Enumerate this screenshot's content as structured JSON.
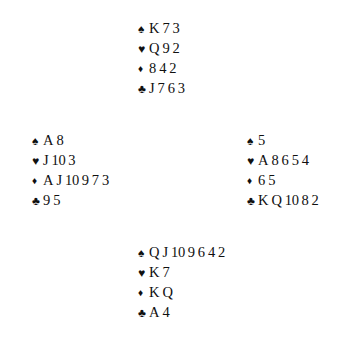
{
  "diagram": {
    "type": "bridge-deal",
    "background_color": "#ffffff",
    "ink_color": "#101010",
    "suit_symbols": {
      "spade": "♠",
      "heart": "♥",
      "diamond": "♦",
      "club": "♣"
    },
    "suit_order": [
      "spade",
      "heart",
      "diamond",
      "club"
    ]
  },
  "hands": {
    "north": {
      "position_label": "North",
      "suits": [
        {
          "suit": "spade",
          "symbol": "♠",
          "cards": [
            "K",
            "7",
            "3"
          ]
        },
        {
          "suit": "heart",
          "symbol": "♥",
          "cards": [
            "Q",
            "9",
            "2"
          ]
        },
        {
          "suit": "diamond",
          "symbol": "♦",
          "cards": [
            "8",
            "4",
            "2"
          ]
        },
        {
          "suit": "club",
          "symbol": "♣",
          "cards": [
            "J",
            "7",
            "6",
            "3"
          ]
        }
      ]
    },
    "west": {
      "position_label": "West",
      "suits": [
        {
          "suit": "spade",
          "symbol": "♠",
          "cards": [
            "A",
            "8"
          ]
        },
        {
          "suit": "heart",
          "symbol": "♥",
          "cards": [
            "J",
            "10",
            "3"
          ]
        },
        {
          "suit": "diamond",
          "symbol": "♦",
          "cards": [
            "A",
            "J",
            "10",
            "9",
            "7",
            "3"
          ]
        },
        {
          "suit": "club",
          "symbol": "♣",
          "cards": [
            "9",
            "5"
          ]
        }
      ]
    },
    "east": {
      "position_label": "East",
      "suits": [
        {
          "suit": "spade",
          "symbol": "♠",
          "cards": [
            "5"
          ]
        },
        {
          "suit": "heart",
          "symbol": "♥",
          "cards": [
            "A",
            "8",
            "6",
            "5",
            "4"
          ]
        },
        {
          "suit": "diamond",
          "symbol": "♦",
          "cards": [
            "6",
            "5"
          ]
        },
        {
          "suit": "club",
          "symbol": "♣",
          "cards": [
            "K",
            "Q",
            "10",
            "8",
            "2"
          ]
        }
      ]
    },
    "south": {
      "position_label": "South",
      "suits": [
        {
          "suit": "spade",
          "symbol": "♠",
          "cards": [
            "Q",
            "J",
            "10",
            "9",
            "6",
            "4",
            "2"
          ]
        },
        {
          "suit": "heart",
          "symbol": "♥",
          "cards": [
            "K",
            "7"
          ]
        },
        {
          "suit": "diamond",
          "symbol": "♦",
          "cards": [
            "K",
            "Q"
          ]
        },
        {
          "suit": "club",
          "symbol": "♣",
          "cards": [
            "A",
            "4"
          ]
        }
      ]
    }
  }
}
